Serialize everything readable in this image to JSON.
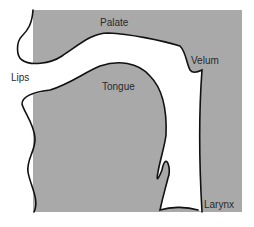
{
  "diagram": {
    "type": "vocal-tract-cross-section",
    "colors": {
      "tissue": "#a9a9a9",
      "airway": "#ffffff",
      "outline": "#111111",
      "label": "#2a2a2a"
    },
    "labels": {
      "palate": "Palate",
      "velum": "Velum",
      "lips": "Lips",
      "tongue": "Tongue",
      "larynx": "Larynx"
    }
  }
}
